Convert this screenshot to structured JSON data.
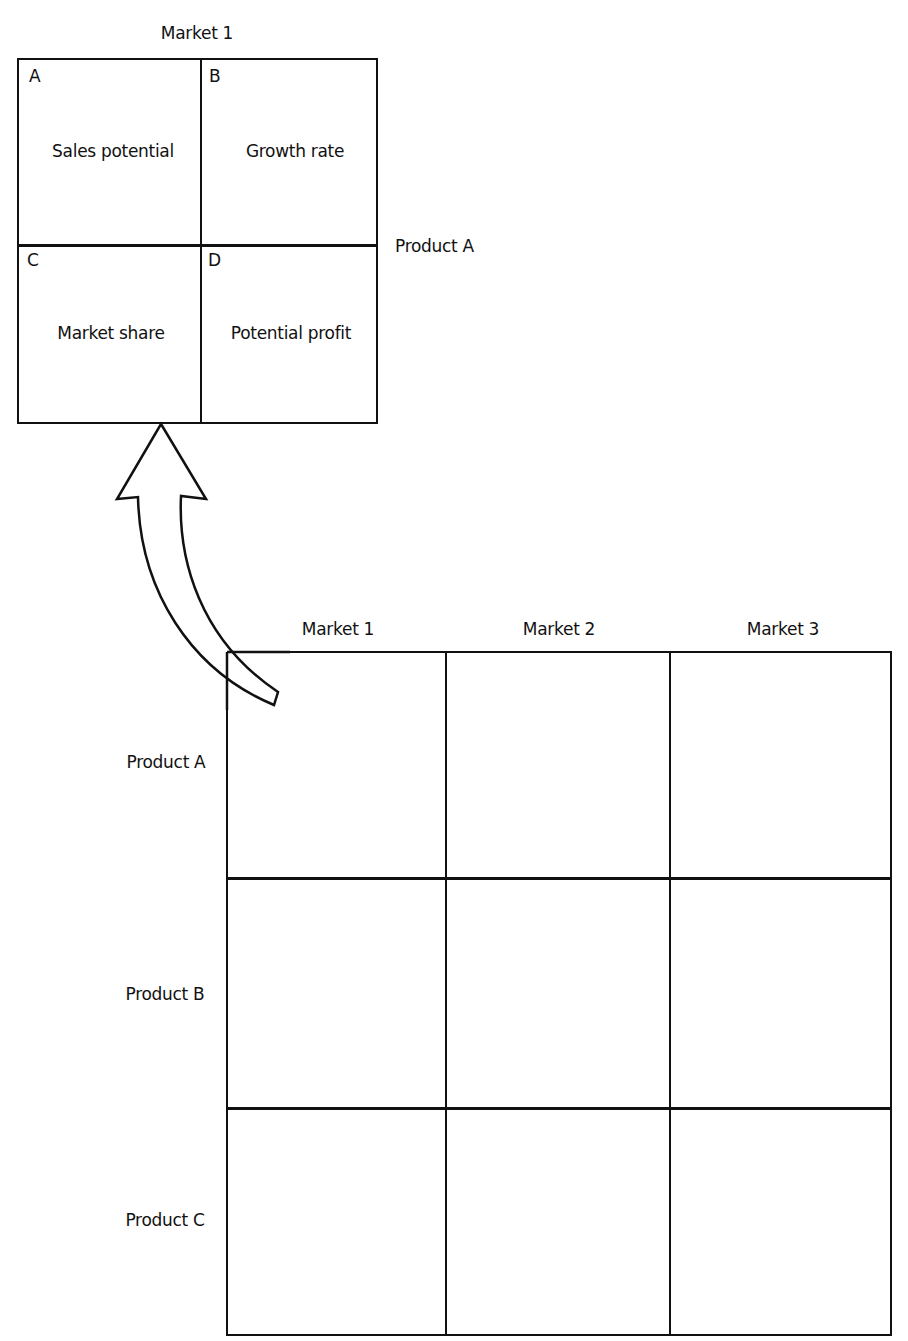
{
  "detail_box": {
    "column_header": "Market 1",
    "row_label": "Product A",
    "cells": [
      {
        "letter": "A",
        "label": "Sales potential"
      },
      {
        "letter": "B",
        "label": "Growth rate"
      },
      {
        "letter": "C",
        "label": "Market share"
      },
      {
        "letter": "D",
        "label": "Potential profit"
      }
    ]
  },
  "matrix": {
    "columns": [
      "Market 1",
      "Market 2",
      "Market 3"
    ],
    "rows": [
      "Product A",
      "Product B",
      "Product C"
    ],
    "cells": [
      [
        "",
        "",
        ""
      ],
      [
        "",
        "",
        ""
      ],
      [
        "",
        "",
        ""
      ]
    ]
  },
  "arrow": {
    "from": "matrix cell Product A / Market 1",
    "to": "detail box"
  },
  "colors": {
    "line": "#111111",
    "background": "#ffffff"
  }
}
